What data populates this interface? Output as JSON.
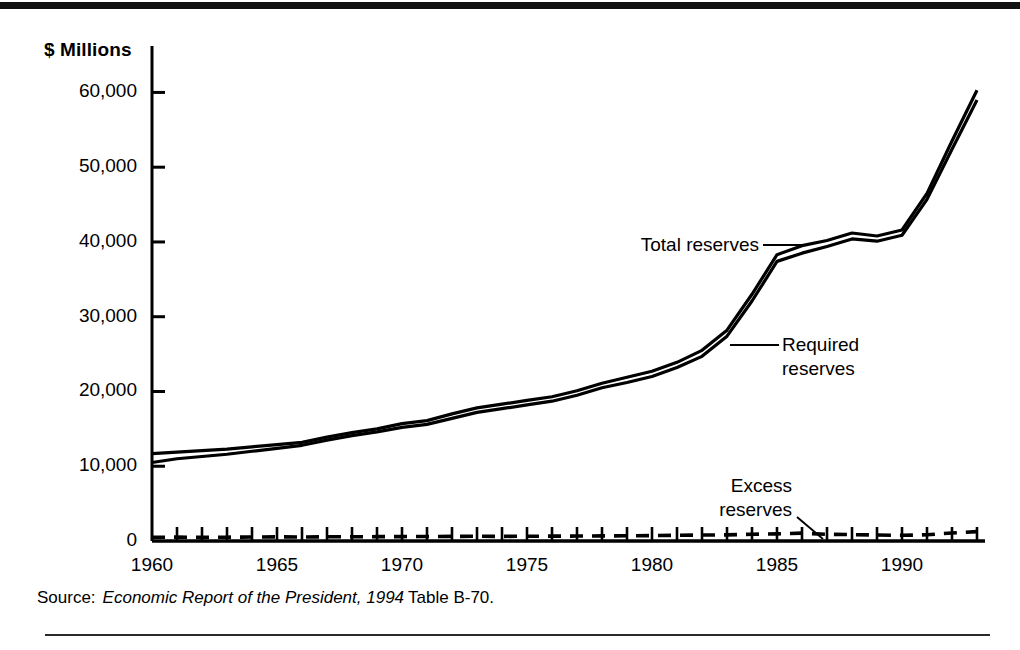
{
  "figure": {
    "unit_label": "$ Millions",
    "source": {
      "label": "Source:",
      "title": "Economic Report of the President, 1994",
      "tail": "Table B-70."
    }
  },
  "annotations": {
    "total": "Total reserves",
    "required": "Required\nreserves",
    "excess": "Excess\nreserves"
  },
  "chart_data": {
    "type": "line",
    "title": "",
    "xlabel": "",
    "ylabel": "$ Millions",
    "xlim": [
      1960,
      1993
    ],
    "ylim": [
      0,
      63000
    ],
    "yticks": [
      0,
      10000,
      20000,
      30000,
      40000,
      50000,
      60000
    ],
    "ytick_labels": [
      "0",
      "10,000",
      "20,000",
      "30,000",
      "40,000",
      "50,000",
      "60,000"
    ],
    "xticks": [
      1960,
      1965,
      1970,
      1975,
      1980,
      1985,
      1990
    ],
    "xtick_labels": [
      "1960",
      "1965",
      "1970",
      "1975",
      "1980",
      "1985",
      "1990"
    ],
    "minor_xticks": true,
    "grid": false,
    "legend": "annotations-with-leader-lines",
    "x": [
      1960,
      1961,
      1962,
      1963,
      1964,
      1965,
      1966,
      1967,
      1968,
      1969,
      1970,
      1971,
      1972,
      1973,
      1974,
      1975,
      1976,
      1977,
      1978,
      1979,
      1980,
      1981,
      1982,
      1983,
      1984,
      1985,
      1986,
      1987,
      1988,
      1989,
      1990,
      1991,
      1992,
      1993
    ],
    "series": [
      {
        "name": "Total reserves",
        "style": "solid",
        "color": "#000000",
        "values": [
          11700,
          11900,
          12100,
          12300,
          12600,
          12900,
          13200,
          13900,
          14500,
          15000,
          15700,
          16100,
          17000,
          17800,
          18300,
          18800,
          19300,
          20100,
          21100,
          21900,
          22700,
          23900,
          25500,
          28200,
          33000,
          38300,
          39500,
          40200,
          41200,
          40800,
          41600,
          46500,
          53500,
          60300
        ]
      },
      {
        "name": "Required reserves",
        "style": "solid",
        "color": "#000000",
        "values": [
          10500,
          11000,
          11300,
          11600,
          12000,
          12400,
          12800,
          13500,
          14100,
          14600,
          15200,
          15600,
          16400,
          17200,
          17700,
          18200,
          18700,
          19500,
          20500,
          21200,
          22000,
          23200,
          24700,
          27400,
          32100,
          37400,
          38500,
          39400,
          40400,
          40100,
          40900,
          45700,
          52400,
          59000
        ]
      },
      {
        "name": "Excess reserves",
        "style": "dashed",
        "color": "#000000",
        "values": [
          500,
          520,
          480,
          510,
          530,
          550,
          540,
          560,
          570,
          580,
          590,
          600,
          620,
          630,
          620,
          640,
          650,
          660,
          680,
          700,
          720,
          760,
          800,
          820,
          900,
          950,
          1050,
          900,
          850,
          800,
          760,
          830,
          1080,
          1250
        ]
      }
    ]
  }
}
